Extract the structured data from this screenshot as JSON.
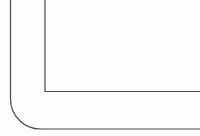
{
  "figure": {
    "kind": "line-drawing",
    "width": 200,
    "height": 136,
    "background_color": "#fdfdfd",
    "stroke_color": "#4a4a52",
    "stroke_width": 1.2
  },
  "geometry": {
    "outer_contour": {
      "name": "outer-contour",
      "path": "M 10.5 0 L 10.5 99 A 30 30 0 0 0 40.5 129 L 200 129",
      "vertical_x": 10.5,
      "vertical_top_y": 0,
      "corner_radius": 30,
      "arc_center_x": 40.5,
      "arc_center_y": 99,
      "horizontal_y": 129,
      "horizontal_end_x": 200
    },
    "inner_contour": {
      "name": "inner-contour",
      "path": "M 45 0 L 45 91.5 L 200 91.5",
      "vertical_x": 45,
      "vertical_top_y": 0,
      "corner_type": "square",
      "corner_x": 45,
      "corner_y": 91.5,
      "horizontal_y": 91.5,
      "horizontal_end_x": 200
    }
  }
}
